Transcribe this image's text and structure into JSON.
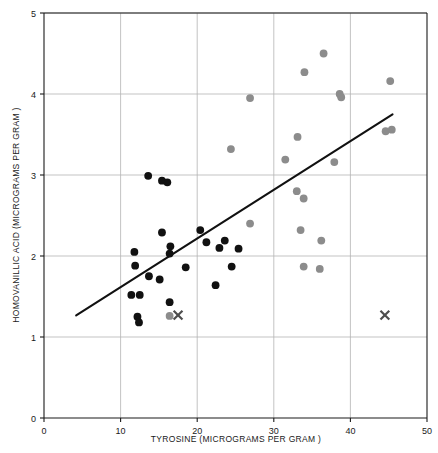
{
  "chart_data": {
    "type": "scatter",
    "title": "",
    "xlabel": "TYROSINE (MICROGRAMS PER GRAM )",
    "ylabel": "HOMOVANILLIC ACID (MICROGRAMS PER GRAM )",
    "xlim": [
      0,
      50
    ],
    "ylim": [
      0,
      5
    ],
    "xticks": [
      0,
      10,
      20,
      30,
      40,
      50
    ],
    "yticks": [
      0,
      1,
      2,
      3,
      4,
      5
    ],
    "xtick_labels": [
      "0",
      "10",
      "20",
      "30",
      "40",
      "50"
    ],
    "ytick_labels": [
      "0",
      "1",
      "2",
      "3",
      "4",
      "5"
    ],
    "grid": true,
    "grid_color": "#b4b4b4",
    "axis_color": "#1a1a1a",
    "legend": null,
    "series": [
      {
        "name": "dark-points",
        "marker": "circle",
        "color": "#111111",
        "points": [
          [
            13.6,
            2.99
          ],
          [
            15.4,
            2.93
          ],
          [
            16.1,
            2.91
          ],
          [
            15.4,
            2.29
          ],
          [
            16.5,
            2.12
          ],
          [
            16.4,
            2.03
          ],
          [
            20.4,
            2.32
          ],
          [
            21.2,
            2.17
          ],
          [
            22.9,
            2.1
          ],
          [
            23.6,
            2.19
          ],
          [
            25.4,
            2.09
          ],
          [
            24.5,
            1.87
          ],
          [
            18.5,
            1.86
          ],
          [
            22.4,
            1.64
          ],
          [
            11.8,
            2.05
          ],
          [
            11.9,
            1.88
          ],
          [
            13.7,
            1.75
          ],
          [
            15.1,
            1.71
          ],
          [
            11.4,
            1.52
          ],
          [
            12.5,
            1.52
          ],
          [
            16.4,
            1.43
          ],
          [
            12.2,
            1.25
          ],
          [
            12.4,
            1.18
          ]
        ]
      },
      {
        "name": "gray-points",
        "marker": "circle",
        "color": "#8c8c8c",
        "points": [
          [
            36.5,
            4.5
          ],
          [
            34.0,
            4.27
          ],
          [
            45.2,
            4.16
          ],
          [
            38.6,
            4.0
          ],
          [
            38.8,
            3.96
          ],
          [
            26.9,
            3.95
          ],
          [
            33.1,
            3.47
          ],
          [
            44.6,
            3.54
          ],
          [
            45.4,
            3.56
          ],
          [
            24.4,
            3.32
          ],
          [
            31.5,
            3.19
          ],
          [
            37.9,
            3.16
          ],
          [
            33.0,
            2.8
          ],
          [
            33.9,
            2.71
          ],
          [
            26.9,
            2.4
          ],
          [
            33.5,
            2.32
          ],
          [
            36.2,
            2.19
          ],
          [
            33.9,
            1.87
          ],
          [
            36.0,
            1.84
          ],
          [
            16.4,
            1.26
          ]
        ]
      },
      {
        "name": "x-markers",
        "marker": "x",
        "color": "#4d4d4d",
        "points": [
          [
            17.5,
            1.27
          ],
          [
            44.5,
            1.27
          ]
        ]
      }
    ]
  }
}
